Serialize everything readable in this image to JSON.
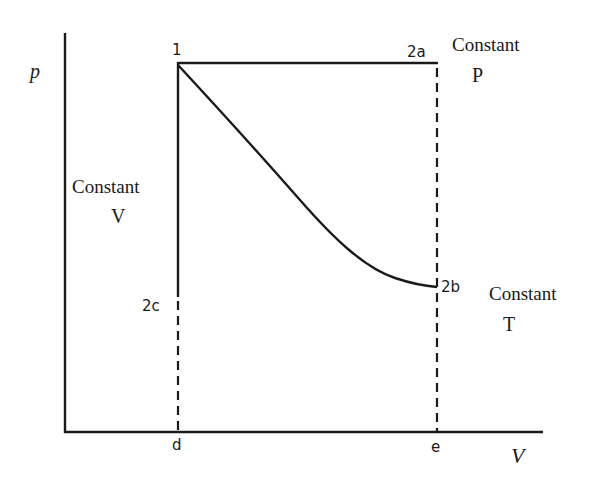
{
  "diagram": {
    "title": "",
    "axes": {
      "y_label": "p",
      "x_label": "V"
    },
    "points": {
      "p1": "1",
      "p2a": "2a",
      "p2b": "2b",
      "p2c": "2c",
      "pd": "d",
      "pe": "e"
    },
    "process_labels": {
      "constant_p": [
        "Constant",
        "P"
      ],
      "constant_t": [
        "Constant",
        "T"
      ],
      "constant_v": [
        "Constant",
        "V"
      ]
    },
    "processes": [
      {
        "name": "isobaric",
        "from": "1",
        "to": "2a",
        "style": "solid"
      },
      {
        "name": "isothermal",
        "from": "1",
        "to": "2b",
        "style": "curve"
      },
      {
        "name": "isochoric",
        "from": "1",
        "to": "2c",
        "style": "solid"
      }
    ],
    "colors": {
      "ink": "#1a1a1a",
      "background": "#ffffff"
    }
  }
}
